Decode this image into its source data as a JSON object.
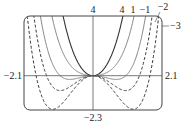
{
  "chart_data": {
    "type": "line",
    "title": "",
    "xlabel": "",
    "ylabel": "",
    "xlim": [
      -2.1,
      2.1
    ],
    "ylim": [
      -2.3,
      4
    ],
    "grid": false,
    "legend": "inline curve labels at top",
    "function_family": "y = x^4 + c x^2",
    "series": [
      {
        "name": "4",
        "c": 4,
        "style": "solid"
      },
      {
        "name": "1",
        "c": 1,
        "style": "solid-light"
      },
      {
        "name": "-1",
        "c": -1,
        "style": "solid-light"
      },
      {
        "name": "-2",
        "c": -2,
        "style": "dashed"
      },
      {
        "name": "-3",
        "c": -3,
        "style": "dashed"
      }
    ],
    "tick_labels": {
      "x_min": "-2.1",
      "x_max": "2.1",
      "y_max": "4",
      "y_min": "-2.3"
    }
  },
  "labels": {
    "y_max": "4",
    "y_min": "−2.3",
    "x_min": "−2.1",
    "x_max": "2.1",
    "curve_4": "4",
    "curve_1": "1",
    "curve_m1": "−1",
    "curve_m2": "−2",
    "curve_m3": "−3"
  }
}
